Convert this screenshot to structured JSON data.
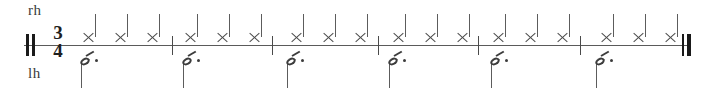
{
  "score": {
    "type": "rhythm-staff",
    "time_signature": {
      "numerator": "3",
      "denominator": "4"
    },
    "start_barline": "thick-thick",
    "end_barline": "thin-thick",
    "staff": {
      "left": 24,
      "right": 691,
      "y": 45
    },
    "measure_count": 6,
    "labels": {
      "right_hand": "rh",
      "left_hand": "lh"
    },
    "colors": {
      "ink": "#3c3c3c",
      "staff_line": "#5a5a5a",
      "barline": "#4a4a4a",
      "heavy_ink": "#1a1a1a",
      "paper": "#ffffff"
    },
    "barlines_x": [
      172,
      272,
      378,
      478,
      580
    ],
    "rh_voice": {
      "label": "rh",
      "notehead": "x-notehead",
      "duration": "quarter",
      "stem_direction": "up",
      "notes_x": [
        83,
        115,
        147,
        185,
        217,
        249,
        291,
        323,
        355,
        393,
        425,
        457,
        493,
        525,
        557,
        601,
        633,
        665
      ],
      "note_count": 18
    },
    "lh_voice": {
      "label": "lh",
      "notehead": "oval",
      "duration": "dotted-eighth",
      "stem_direction": "down",
      "flag_count": 1,
      "augmentation_dots": 1,
      "notes_x": [
        80,
        182,
        286,
        388,
        490,
        595
      ],
      "note_count": 6
    }
  }
}
